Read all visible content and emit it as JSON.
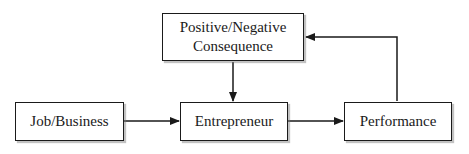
{
  "diagram": {
    "nodes": [
      {
        "id": "consequence",
        "lines": [
          "Positive/Negative",
          "Consequence"
        ]
      },
      {
        "id": "job",
        "lines": [
          "Job/Business"
        ]
      },
      {
        "id": "entrepreneur",
        "lines": [
          "Entrepreneur"
        ]
      },
      {
        "id": "performance",
        "lines": [
          "Performance"
        ]
      }
    ],
    "edges": [
      {
        "from": "job",
        "to": "entrepreneur"
      },
      {
        "from": "entrepreneur",
        "to": "performance"
      },
      {
        "from": "consequence",
        "to": "entrepreneur"
      },
      {
        "from": "performance",
        "to": "consequence"
      }
    ],
    "colors": {
      "stroke": "#1a1a1a",
      "shadow": "#9a9a9a",
      "background": "#ffffff"
    }
  }
}
